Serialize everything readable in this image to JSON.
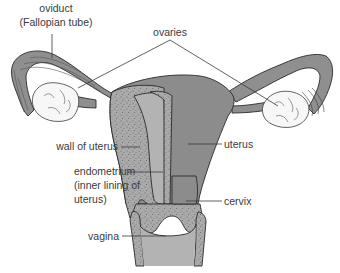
{
  "diagram": {
    "labels": {
      "oviduct_line1": "oviduct",
      "oviduct_line2": "(Fallopian tube)",
      "ovaries": "ovaries",
      "wall_of_uterus": "wall of uterus",
      "endometrium_line1": "endometrium",
      "endometrium_line2": "(inner lining of",
      "endometrium_line3": "uterus)",
      "uterus": "uterus",
      "cervix": "cervix",
      "vagina": "vagina"
    },
    "colors": {
      "tissue": "#8c8c8c",
      "wall_speckle": "#a8a8a8",
      "cavity": "#b3b3b3",
      "ovary": "#f7f7f7",
      "outline": "#2a2a2a"
    }
  }
}
